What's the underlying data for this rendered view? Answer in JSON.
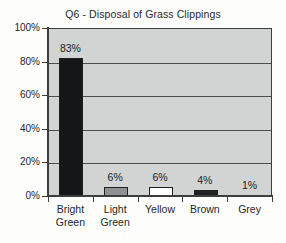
{
  "chart_data": {
    "type": "bar",
    "title": "Q6 - Disposal of Grass Clippings",
    "xlabel": "",
    "ylabel": "",
    "categories": [
      "Bright Green",
      "Light Green",
      "Yellow",
      "Brown",
      "Grey"
    ],
    "values": [
      83,
      6,
      6,
      4,
      1
    ],
    "value_labels": [
      "83%",
      "6%",
      "6%",
      "4%",
      "1%"
    ],
    "ylim": [
      0,
      100
    ],
    "ytick_labels": [
      "100%",
      "80%",
      "60%",
      "40%",
      "20%",
      "0%"
    ],
    "ytick_values": [
      100,
      80,
      60,
      40,
      20,
      0
    ],
    "grid": "horizontal",
    "legend": "none",
    "units": "percent",
    "bar_colors": [
      "#141618",
      "#8e9092",
      "#fdfdfd",
      "#1f2123",
      "#4e5052"
    ],
    "bar_border_color": "#1d1f20",
    "plot_background": "#d2d3d3",
    "axis_color": "#3b3d3f",
    "gridline_color": "#4a4c4e",
    "page_background": "#fdfdfc",
    "series": [
      {
        "name": "Disposal of Grass Clippings",
        "points": [
          {
            "category": "Bright Green",
            "label_line1": "Bright",
            "label_line2": "Green",
            "value": 83,
            "value_label": "83%",
            "color": "#141618"
          },
          {
            "category": "Light Green",
            "label_line1": "Light",
            "label_line2": "Green",
            "value": 6,
            "value_label": "6%",
            "color": "#8e9092"
          },
          {
            "category": "Yellow",
            "label_line1": "Yellow",
            "label_line2": "",
            "value": 6,
            "value_label": "6%",
            "color": "#fdfdfd"
          },
          {
            "category": "Brown",
            "label_line1": "Brown",
            "label_line2": "",
            "value": 4,
            "value_label": "4%",
            "color": "#1f2123"
          },
          {
            "category": "Grey",
            "label_line1": "Grey",
            "label_line2": "",
            "value": 1,
            "value_label": "1%",
            "color": "#4e5052"
          }
        ]
      }
    ]
  }
}
